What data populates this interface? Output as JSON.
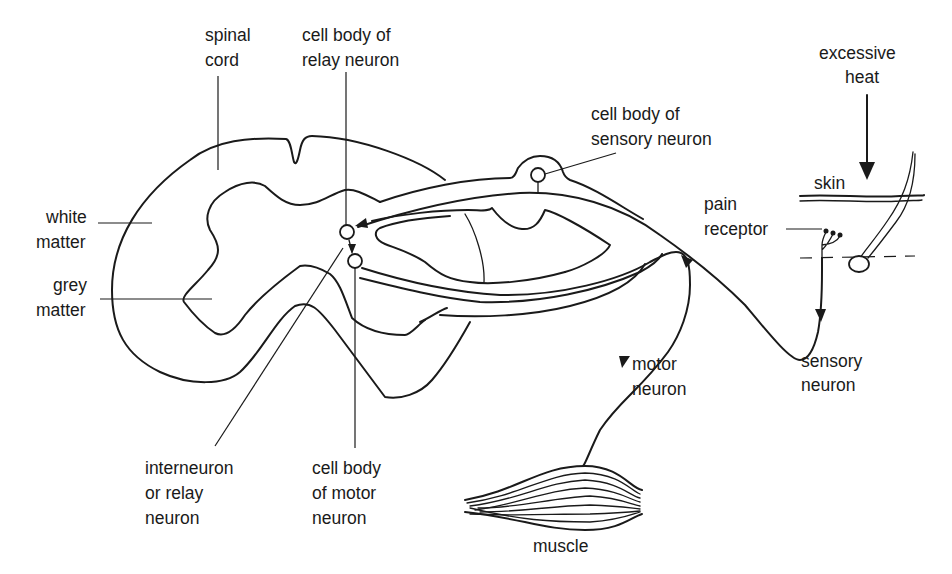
{
  "diagram": {
    "labels": {
      "spinal_cord": [
        "spinal",
        "cord"
      ],
      "cell_body_relay": [
        "cell body of",
        "relay neuron"
      ],
      "cell_body_sensory": [
        "cell body of",
        "sensory neuron"
      ],
      "excessive_heat": [
        "excessive",
        "heat"
      ],
      "skin": "skin",
      "pain_receptor": [
        "pain",
        "receptor"
      ],
      "white_matter": [
        "white",
        "matter"
      ],
      "grey_matter": [
        "grey",
        "matter"
      ],
      "motor_neuron": [
        "motor",
        "neuron"
      ],
      "sensory_neuron": [
        "sensory",
        "neuron"
      ],
      "interneuron": [
        "interneuron",
        "or relay",
        "neuron"
      ],
      "cell_body_motor": [
        "cell body",
        "of motor",
        "neuron"
      ],
      "muscle": "muscle"
    },
    "colors": {
      "line": "#1a1a1a",
      "background": "#ffffff"
    }
  }
}
